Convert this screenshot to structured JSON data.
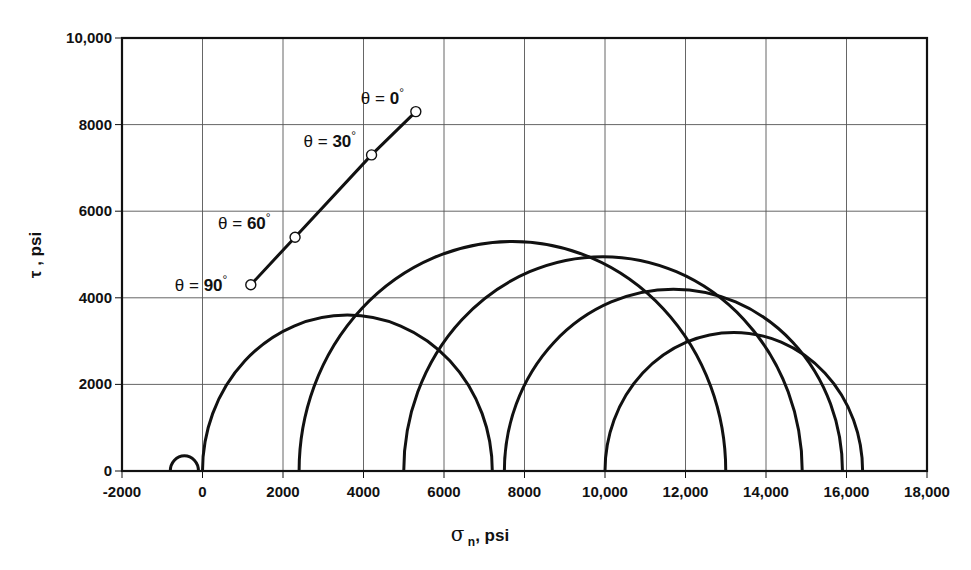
{
  "chart_data": {
    "type": "line",
    "title": "",
    "xlabel": "σ n, psi",
    "xlabel_symbol": "σ",
    "xlabel_sub": "n",
    "xlabel_unit": ", psi",
    "ylabel": "τ , psi",
    "xlim": [
      -2000,
      18000
    ],
    "ylim": [
      0,
      10000
    ],
    "grid": true,
    "legend": null,
    "x_ticks": [
      -2000,
      0,
      2000,
      4000,
      6000,
      8000,
      10000,
      12000,
      14000,
      16000,
      18000
    ],
    "x_tick_labels": [
      "-2000",
      "0",
      "2000",
      "4000",
      "6000",
      "8000",
      "10,000",
      "12,000",
      "14,000",
      "16,000",
      "18,000"
    ],
    "y_ticks": [
      0,
      2000,
      4000,
      6000,
      8000,
      10000
    ],
    "y_tick_labels": [
      "0",
      "2000",
      "4000",
      "6000",
      "8000",
      "10,000"
    ],
    "mohr_circles": [
      {
        "name": "circle-1",
        "sigma_min": -800,
        "sigma_max": -100,
        "center": -450,
        "radius": 350
      },
      {
        "name": "circle-2",
        "sigma_min": 0,
        "sigma_max": 7200,
        "center": 3600,
        "radius": 3600
      },
      {
        "name": "circle-3",
        "sigma_min": 2400,
        "sigma_max": 13000,
        "center": 7700,
        "radius": 5300
      },
      {
        "name": "circle-4",
        "sigma_min": 5000,
        "sigma_max": 14900,
        "center": 9950,
        "radius": 4950
      },
      {
        "name": "circle-5",
        "sigma_min": 7500,
        "sigma_max": 15900,
        "center": 11700,
        "radius": 4200
      },
      {
        "name": "circle-6",
        "sigma_min": 10000,
        "sigma_max": 16400,
        "center": 13200,
        "radius": 3200
      }
    ],
    "failure_envelope": {
      "name": "theta-line",
      "points": [
        {
          "label": "θ = 90°",
          "theta": 90,
          "x": 1200,
          "y": 4300
        },
        {
          "label": "θ = 60°",
          "theta": 60,
          "x": 2300,
          "y": 5400
        },
        {
          "label": "θ = 30°",
          "theta": 30,
          "x": 4200,
          "y": 7300
        },
        {
          "label": "θ = 0°",
          "theta": 0,
          "x": 5300,
          "y": 8300
        }
      ]
    }
  },
  "labels": {
    "theta_prefix": "θ = ",
    "degree": "°"
  }
}
